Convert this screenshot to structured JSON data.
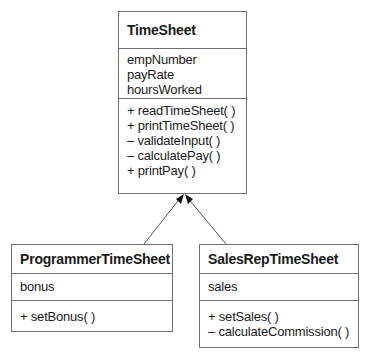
{
  "diagram": {
    "type": "UML class diagram",
    "classes": {
      "timesheet": {
        "name": "TimeSheet",
        "attributes": [
          "empNumber",
          "payRate",
          "hoursWorked"
        ],
        "operations": [
          "+ readTimeSheet( )",
          "+ printTimeSheet( )",
          "– validateInput( )",
          "– calculatePay( )",
          "+ printPay( )"
        ]
      },
      "programmer": {
        "name": "ProgrammerTimeSheet",
        "attributes": [
          "bonus"
        ],
        "operations": [
          "+ setBonus( )"
        ]
      },
      "salesrep": {
        "name": "SalesRepTimeSheet",
        "attributes": [
          "sales"
        ],
        "operations": [
          "+ setSales( )",
          "– calculateCommission( )"
        ]
      }
    },
    "relationships": [
      {
        "type": "generalization",
        "from": "ProgrammerTimeSheet",
        "to": "TimeSheet"
      },
      {
        "type": "generalization",
        "from": "SalesRepTimeSheet",
        "to": "TimeSheet"
      }
    ],
    "colors": {
      "border": "#6e6e6e",
      "text": "#1a1a1a",
      "background": "#ffffff"
    }
  }
}
